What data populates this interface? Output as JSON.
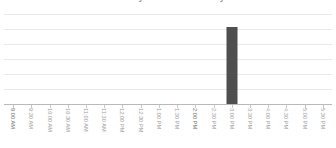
{
  "chart": {
    "title": "Activity Volume — Today",
    "accent_color": "#4f4f4f",
    "gridline_color": "#e9e9e9",
    "axis_color": "#b9b9b9",
    "label_color": "#9a9a9a"
  },
  "chart_data": {
    "type": "bar",
    "title": "Activity Volume — Today",
    "xlabel": "",
    "ylabel": "",
    "grid": true,
    "legend": "none",
    "ylim": [
      0,
      7
    ],
    "gridline_count": 7,
    "categories": [
      "9:00 AM",
      "9:30 AM",
      "10:00 AM",
      "10:30 AM",
      "11:00 AM",
      "11:30 AM",
      "12:00 PM",
      "12:30 PM",
      "1:00 PM",
      "1:30 PM",
      "2:00 PM",
      "2:30 PM",
      "3:00 PM",
      "3:30 PM",
      "4:00 PM",
      "4:30 PM",
      "5:00 PM",
      "5:30 PM"
    ],
    "emphasized_categories": [
      "9:00 AM",
      "2:00 PM"
    ],
    "values": [
      0,
      0,
      0,
      0,
      0,
      0,
      0,
      0,
      0,
      0,
      0,
      0,
      6,
      0,
      0,
      0,
      0,
      0
    ]
  }
}
